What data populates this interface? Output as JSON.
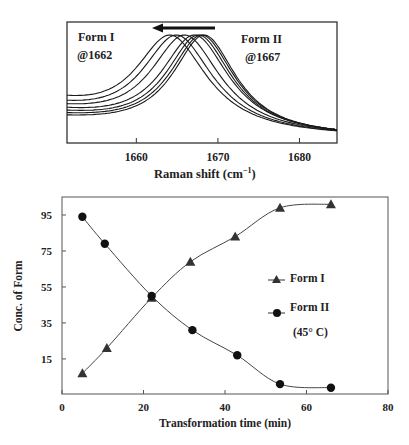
{
  "chart_data": [
    {
      "type": "line",
      "title": "",
      "xlabel": "Raman shift (cm⁻¹)",
      "ylabel": "",
      "xlim": [
        1651.5,
        1684.6
      ],
      "xticks": [
        1660,
        1670,
        1680
      ],
      "grid": false,
      "annotations": [
        {
          "text": "Form I",
          "sub": "@1662",
          "position": "top-left"
        },
        {
          "text": "Form II",
          "sub": "@1667",
          "position": "top-right"
        },
        {
          "text": "arrow pointing left",
          "from": 1669.5,
          "to": 1662
        }
      ],
      "series": [
        {
          "name": "spectrum 1",
          "peak": 1668.3,
          "width": 5.2,
          "left_offset": 0.16
        },
        {
          "name": "spectrum 2",
          "peak": 1668.0,
          "width": 5.3,
          "left_offset": 0.18
        },
        {
          "name": "spectrum 3",
          "peak": 1667.6,
          "width": 5.4,
          "left_offset": 0.2
        },
        {
          "name": "spectrum 4",
          "peak": 1667.1,
          "width": 5.6,
          "left_offset": 0.22
        },
        {
          "name": "spectrum 5",
          "peak": 1665.9,
          "width": 5.8,
          "left_offset": 0.24
        },
        {
          "name": "spectrum 6",
          "peak": 1664.9,
          "width": 5.9,
          "left_offset": 0.26
        },
        {
          "name": "spectrum 7",
          "peak": 1664.1,
          "width": 6.0,
          "left_offset": 0.3
        }
      ]
    },
    {
      "type": "line",
      "title": "",
      "xlabel": "Transformation time (min)",
      "ylabel": "Conc. of Form",
      "xlim": [
        0,
        80
      ],
      "ylim": [
        -4.5,
        105
      ],
      "xticks": [
        0,
        20,
        40,
        60,
        80
      ],
      "yticks": [
        15,
        35,
        55,
        75,
        95
      ],
      "grid": false,
      "legend_position": "right-center",
      "legend": [
        "Form I",
        "Form II",
        "(45° C)"
      ],
      "series": [
        {
          "name": "Form I",
          "marker": "triangle",
          "x": [
            5,
            11,
            22,
            31.5,
            42.5,
            53.5,
            66
          ],
          "values": [
            7,
            21,
            49,
            69,
            83,
            99,
            101
          ]
        },
        {
          "name": "Form II",
          "marker": "circle",
          "x": [
            5,
            10.5,
            22,
            32,
            43,
            53.5,
            66
          ],
          "values": [
            94,
            79,
            50,
            31,
            17,
            1,
            -1
          ]
        }
      ]
    }
  ],
  "labels": {
    "top_xlabel": "Raman shift (cm",
    "top_xlabel_sup": "−1",
    "top_xlabel_end": ")",
    "form1": "Form I",
    "form1_peak": "@1662",
    "form2": "Form II",
    "form2_peak": "@1667",
    "bottom_xlabel": "Transformation time (min)",
    "bottom_ylabel": "Conc. of Form",
    "legend_form1": "Form I",
    "legend_form2": "Form II",
    "legend_temp": "(45° C)"
  },
  "colors": {
    "line": "#222222",
    "axis": "#333333",
    "curve": "#1a1a1a"
  }
}
